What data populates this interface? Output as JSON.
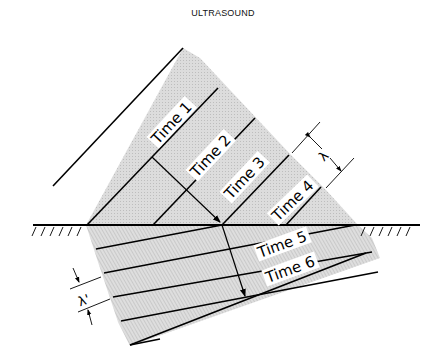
{
  "title": "ULTRASOUND",
  "labels": {
    "time1": "Time 1",
    "time2": "Time 2",
    "time3": "Time 3",
    "time4": "Time 4",
    "time5": "Time 5",
    "time6": "Time 6",
    "lambda": "λ",
    "lambda_prime": "λ'"
  },
  "colors": {
    "line": "#000000",
    "shade": "#d4d4d4",
    "background": "#ffffff"
  }
}
